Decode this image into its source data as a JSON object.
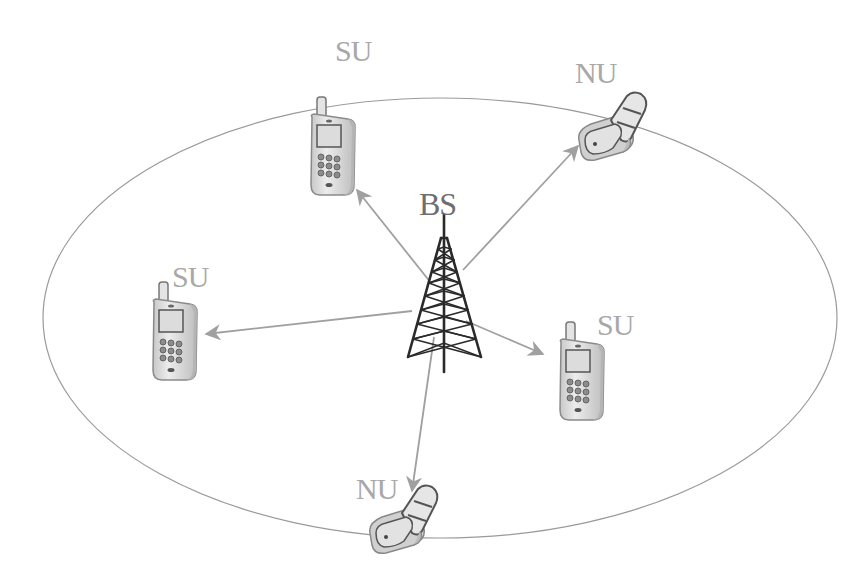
{
  "diagram": {
    "title": "",
    "colors": {
      "ellipse": "#9a9a9a",
      "arrow": "#a0a0a0",
      "label": "#a8a8a8",
      "bs_label": "#6e6e6e",
      "tower": "#2a2a2a",
      "phone_body": "#d9d9d9",
      "phone_outline": "#7a7a7a"
    },
    "coverage_area": {
      "shape": "ellipse",
      "cx": 440,
      "cy": 318,
      "rx": 397,
      "ry": 220
    },
    "base_station": {
      "label": "BS",
      "icon": "antenna-tower-icon",
      "x": 444,
      "y": 215
    },
    "nodes": [
      {
        "id": "su_top",
        "label": "SU",
        "type": "candybar-phone-icon"
      },
      {
        "id": "nu_top_right",
        "label": "NU",
        "type": "flip-phone-icon"
      },
      {
        "id": "su_left",
        "label": "SU",
        "type": "candybar-phone-icon"
      },
      {
        "id": "su_right",
        "label": "SU",
        "type": "candybar-phone-icon"
      },
      {
        "id": "nu_bottom",
        "label": "NU",
        "type": "flip-phone-icon"
      }
    ],
    "edges": [
      {
        "from": "BS",
        "to": "su_top"
      },
      {
        "from": "BS",
        "to": "nu_top_right"
      },
      {
        "from": "BS",
        "to": "su_left"
      },
      {
        "from": "BS",
        "to": "su_right"
      },
      {
        "from": "BS",
        "to": "nu_bottom"
      }
    ]
  }
}
